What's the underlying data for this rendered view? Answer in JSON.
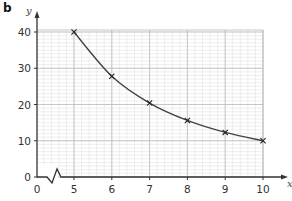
{
  "part_label": "b",
  "chart_data": {
    "type": "line",
    "title": "",
    "xlabel": "x",
    "ylabel": "y",
    "x": [
      5,
      6,
      7,
      8,
      9,
      10
    ],
    "series": [
      {
        "name": "y",
        "values": [
          40,
          27.8,
          20.4,
          15.6,
          12.3,
          10
        ],
        "marker": "x",
        "smooth": true
      }
    ],
    "x_ticks": [
      "0",
      "5",
      "6",
      "7",
      "8",
      "9",
      "10"
    ],
    "y_ticks": [
      "0",
      "10",
      "20",
      "30",
      "40"
    ],
    "xlim": [
      5,
      10
    ],
    "ylim": [
      0,
      40
    ],
    "x_axis_break": true,
    "grid": true,
    "legend": "none"
  },
  "colors": {
    "curve": "#444444",
    "axis": "#333333",
    "grid_major": "#bbbbbb",
    "grid_minor": "#e2e2e2"
  }
}
